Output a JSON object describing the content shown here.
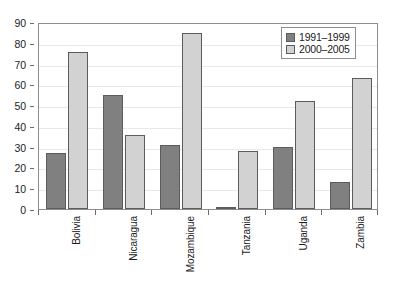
{
  "chart_data": {
    "type": "bar",
    "title": "",
    "subtitle": "",
    "xlabel": "",
    "ylabel": "",
    "categories": [
      "Bolivia",
      "Nicaragua",
      "Mozambique",
      "Tanzania",
      "Uganda",
      "Zambia"
    ],
    "series": [
      {
        "name": "1991–1999",
        "color": "#808080",
        "values": [
          27,
          55,
          31,
          0.4,
          30,
          13
        ]
      },
      {
        "name": "2000–2005",
        "color": "#d2d2d2",
        "values": [
          75.5,
          35.5,
          84.5,
          28,
          52,
          63
        ]
      }
    ],
    "ylim": [
      0,
      90
    ],
    "ytick_step": 10,
    "yticks": [
      0,
      10,
      20,
      30,
      40,
      50,
      60,
      70,
      80,
      90
    ],
    "ytick_labels": [
      "0",
      "10",
      "20",
      "30",
      "40",
      "50",
      "60",
      "70",
      "80",
      "90"
    ],
    "grid": true,
    "grid_axis": "y",
    "legend_position": "top-right",
    "legend_entries": [
      "1991–1999",
      "2000–2005"
    ]
  }
}
